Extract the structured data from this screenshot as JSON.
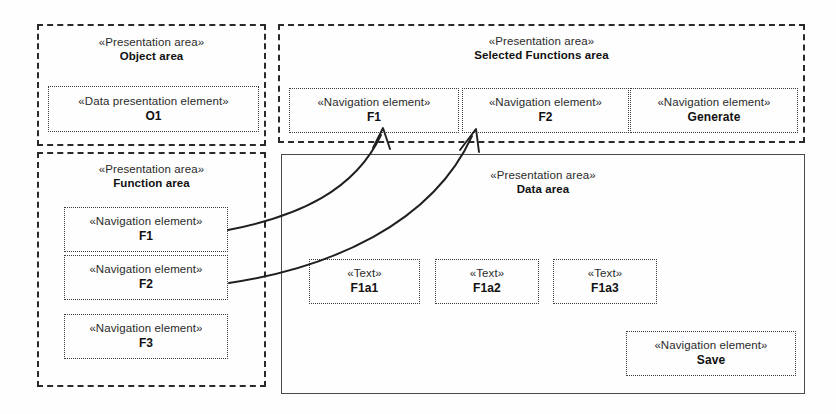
{
  "diagram": {
    "type": "uml-presentation-area-diagram",
    "background_color": "#fefefe",
    "line_color": "#2a2a2a"
  },
  "stereotypes": {
    "presentation_area": "«Presentation area»",
    "data_presentation_element": "«Data presentation element»",
    "navigation_element": "«Navigation element»",
    "text": "«Text»"
  },
  "areas": {
    "object_area": {
      "stereotype": "«Presentation area»",
      "name": "Object area",
      "border_style": "dashed",
      "elements": [
        {
          "stereotype": "«Data presentation element»",
          "name": "O1"
        }
      ]
    },
    "selected_functions_area": {
      "stereotype": "«Presentation area»",
      "name": "Selected Functions area",
      "border_style": "dashed",
      "elements": [
        {
          "stereotype": "«Navigation element»",
          "name": "F1"
        },
        {
          "stereotype": "«Navigation element»",
          "name": "F2"
        },
        {
          "stereotype": "«Navigation element»",
          "name": "Generate"
        }
      ]
    },
    "function_area": {
      "stereotype": "«Presentation area»",
      "name": "Function area",
      "border_style": "dashed",
      "elements": [
        {
          "stereotype": "«Navigation element»",
          "name": "F1"
        },
        {
          "stereotype": "«Navigation element»",
          "name": "F2"
        },
        {
          "stereotype": "«Navigation element»",
          "name": "F3"
        }
      ]
    },
    "data_area": {
      "stereotype": "«Presentation area»",
      "name": "Data area",
      "border_style": "solid",
      "elements": [
        {
          "stereotype": "«Text»",
          "name": "F1a1"
        },
        {
          "stereotype": "«Text»",
          "name": "F1a2"
        },
        {
          "stereotype": "«Text»",
          "name": "F1a3"
        },
        {
          "stereotype": "«Navigation element»",
          "name": "Save"
        }
      ]
    }
  },
  "connectors": [
    {
      "id": "arrow-f1",
      "from": "function-area-element-f1",
      "to": "selected-functions-element-f1",
      "style": "curved-open-arrow"
    },
    {
      "id": "arrow-f2",
      "from": "function-area-element-f2",
      "to": "selected-functions-element-f2",
      "style": "curved-open-arrow"
    }
  ]
}
